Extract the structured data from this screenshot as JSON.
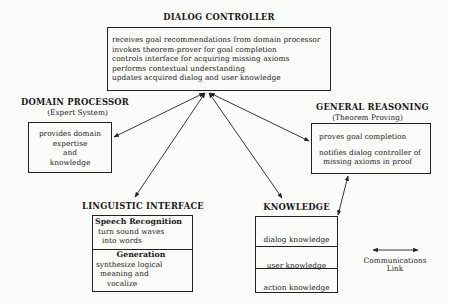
{
  "dialog_controller": {
    "title": "DIALOG CONTROLLER",
    "lines": [
      "receives goal recommendations from domain processor",
      "invokes theorem-prover for goal completion",
      "controls interface for acquiring missing axioms",
      "performs contextual understanding",
      "updates acquired dialog and user knowledge"
    ]
  },
  "domain_processor": {
    "title": "DOMAIN PROCESSOR",
    "subtitle": "(Expert System)",
    "lines": [
      "provides domain",
      "expertise",
      "and",
      "knowledge"
    ]
  },
  "general_reasoning": {
    "title": "GENERAL REASONING",
    "subtitle": "(Theorem Proving)",
    "lines": [
      "proves goal completion",
      "notifies dialog controller of",
      "missing axioms in proof"
    ]
  },
  "linguistic_interface": {
    "title": "LINGUISTIC INTERFACE",
    "sections": [
      {
        "heading": "Speech Recognition",
        "lines": [
          "turn sound waves",
          "into words"
        ]
      },
      {
        "heading": "Generation",
        "lines": [
          "synthesize logical",
          "meaning and",
          "vocalize"
        ]
      }
    ]
  },
  "knowledge": {
    "title": "KNOWLEDGE",
    "items": [
      "dialog knowledge",
      "user knowledge",
      "action knowledge"
    ]
  },
  "legend": {
    "label_line1": "Communications",
    "label_line2": "Link"
  },
  "colors": {
    "line": "#222222",
    "background": "#fbfbf9"
  }
}
